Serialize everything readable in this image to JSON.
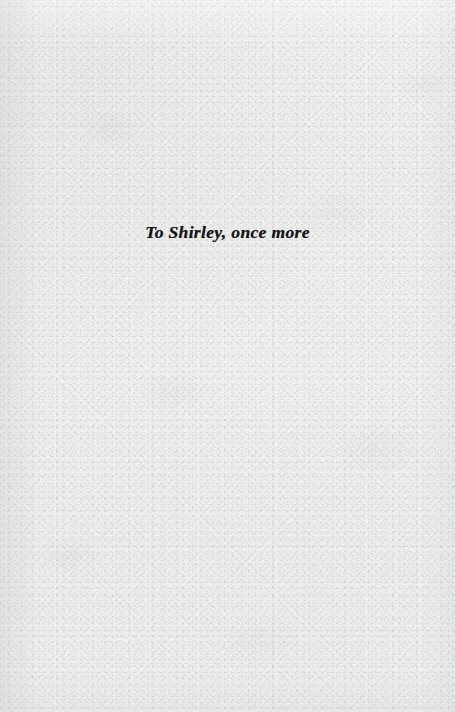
{
  "page": {
    "kind": "book-dedication-page",
    "paper_color": "#f1f1ef",
    "ink_color": "#16161a"
  },
  "dedication": {
    "text": "To Shirley, once more"
  }
}
